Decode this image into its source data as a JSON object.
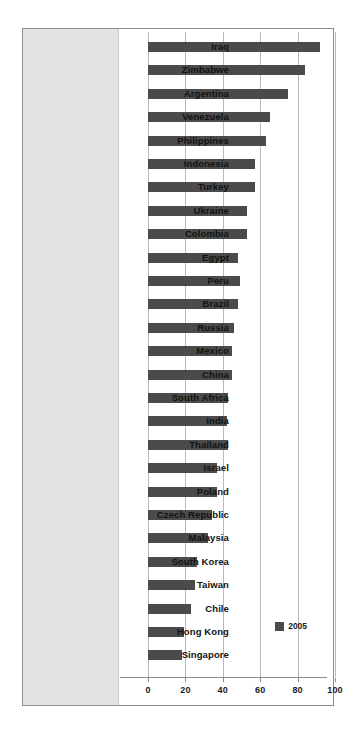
{
  "chart_data": {
    "type": "bar",
    "orientation": "horizontal",
    "title": "",
    "subtitle": "",
    "xlabel": "",
    "ylabel": "",
    "xlim": [
      0,
      100
    ],
    "xticks": [
      0,
      20,
      40,
      60,
      80,
      100
    ],
    "xtick_labels": [
      "0",
      "20",
      "40",
      "60",
      "80",
      "100"
    ],
    "grid": true,
    "grid_axis": "x",
    "legend": {
      "position": "bottom-right-inside",
      "entries": [
        {
          "label": "2005",
          "color": "#4b4b4b"
        }
      ]
    },
    "series": [
      {
        "name": "2005",
        "color": "#4b4b4b",
        "values": [
          92,
          84,
          75,
          65,
          63,
          57,
          57,
          53,
          53,
          48,
          49,
          48,
          46,
          45,
          45,
          43,
          42,
          43,
          37,
          37,
          34,
          32,
          26,
          25,
          23,
          19,
          18
        ]
      }
    ],
    "categories": [
      "Iraq",
      "Zimbabwe",
      "Argentina",
      "Venezuela",
      "Philippines",
      "Indonesia",
      "Turkey",
      "Ukraine",
      "Colombia",
      "Egypt",
      "Peru",
      "Brazil",
      "Russia",
      "Mexico",
      "China",
      "South Africa",
      "India",
      "Thailand",
      "Israel",
      "Poland",
      "Czech Republic",
      "Malaysia",
      "South Korea",
      "Taiwan",
      "Chile",
      "Hong Kong",
      "Singapore"
    ]
  },
  "style": {
    "bar_color": "#4b4b4b",
    "gutter_color": "#e3e3e3",
    "frame_color": "#8d8d8d",
    "grid_color": "#b9b9b9",
    "text_color": "#121212",
    "background": "#ffffff"
  }
}
